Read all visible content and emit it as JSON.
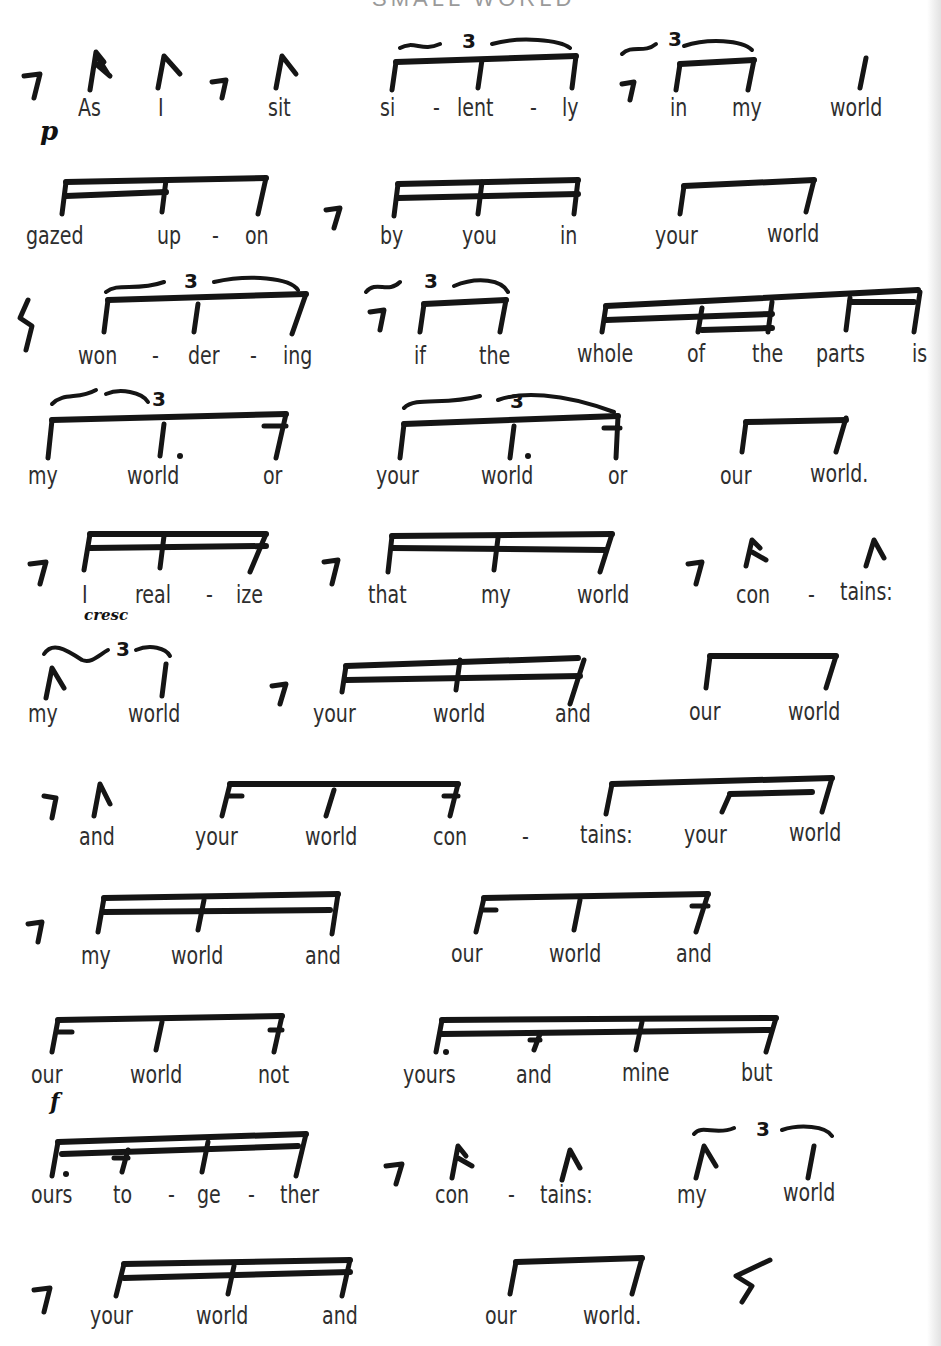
{
  "page": {
    "title_fragment": "SMALL WORLD",
    "lines": [
      {
        "id": 1,
        "text": "As I sit si-lent-ly in my world",
        "syllables": [
          {
            "t": "As",
            "x": 78,
            "y": 96
          },
          {
            "t": "I",
            "x": 158,
            "y": 96
          },
          {
            "t": "sit",
            "x": 268,
            "y": 96
          },
          {
            "t": "si",
            "x": 380,
            "y": 96
          },
          {
            "t": "-",
            "x": 433,
            "y": 96
          },
          {
            "t": "lent",
            "x": 457,
            "y": 96
          },
          {
            "t": "-",
            "x": 530,
            "y": 96
          },
          {
            "t": "ly",
            "x": 562,
            "y": 96
          },
          {
            "t": "in",
            "x": 670,
            "y": 96
          },
          {
            "t": "my",
            "x": 732,
            "y": 96
          },
          {
            "t": "world",
            "x": 830,
            "y": 96
          }
        ]
      },
      {
        "id": 2,
        "text": "gazed up-on by you in your world",
        "syllables": [
          {
            "t": "gazed",
            "x": 26,
            "y": 224
          },
          {
            "t": "up",
            "x": 157,
            "y": 224
          },
          {
            "t": "-",
            "x": 212,
            "y": 224
          },
          {
            "t": "on",
            "x": 245,
            "y": 224
          },
          {
            "t": "by",
            "x": 380,
            "y": 224
          },
          {
            "t": "you",
            "x": 462,
            "y": 224
          },
          {
            "t": "in",
            "x": 560,
            "y": 224
          },
          {
            "t": "your",
            "x": 655,
            "y": 224
          },
          {
            "t": "world",
            "x": 767,
            "y": 222
          }
        ]
      },
      {
        "id": 3,
        "text": "won-der-ing if the whole of the parts is",
        "syllables": [
          {
            "t": "won",
            "x": 78,
            "y": 344
          },
          {
            "t": "-",
            "x": 152,
            "y": 344
          },
          {
            "t": "der",
            "x": 188,
            "y": 344
          },
          {
            "t": "-",
            "x": 250,
            "y": 344
          },
          {
            "t": "ing",
            "x": 283,
            "y": 344
          },
          {
            "t": "if",
            "x": 414,
            "y": 344
          },
          {
            "t": "the",
            "x": 479,
            "y": 344
          },
          {
            "t": "whole",
            "x": 577,
            "y": 342
          },
          {
            "t": "of",
            "x": 687,
            "y": 342
          },
          {
            "t": "the",
            "x": 752,
            "y": 342
          },
          {
            "t": "parts",
            "x": 816,
            "y": 342
          },
          {
            "t": "is",
            "x": 912,
            "y": 342
          }
        ]
      },
      {
        "id": 4,
        "text": "my world or your world or our world.",
        "syllables": [
          {
            "t": "my",
            "x": 28,
            "y": 464
          },
          {
            "t": "world",
            "x": 127,
            "y": 464
          },
          {
            "t": "or",
            "x": 263,
            "y": 464
          },
          {
            "t": "your",
            "x": 376,
            "y": 464
          },
          {
            "t": "world",
            "x": 481,
            "y": 464
          },
          {
            "t": "or",
            "x": 608,
            "y": 464
          },
          {
            "t": "our",
            "x": 720,
            "y": 464
          },
          {
            "t": "world.",
            "x": 810,
            "y": 462
          }
        ]
      },
      {
        "id": 5,
        "text": "I real-ize that my world con-tains:",
        "syllables": [
          {
            "t": "I",
            "x": 82,
            "y": 583
          },
          {
            "t": "real",
            "x": 135,
            "y": 583
          },
          {
            "t": "-",
            "x": 206,
            "y": 583
          },
          {
            "t": "ize",
            "x": 236,
            "y": 583
          },
          {
            "t": "that",
            "x": 368,
            "y": 583
          },
          {
            "t": "my",
            "x": 481,
            "y": 583
          },
          {
            "t": "world",
            "x": 577,
            "y": 583
          },
          {
            "t": "con",
            "x": 736,
            "y": 583
          },
          {
            "t": "-",
            "x": 808,
            "y": 583
          },
          {
            "t": "tains:",
            "x": 840,
            "y": 580
          }
        ]
      },
      {
        "id": 6,
        "text": "my world your world and our world",
        "syllables": [
          {
            "t": "my",
            "x": 28,
            "y": 702
          },
          {
            "t": "world",
            "x": 128,
            "y": 702
          },
          {
            "t": "your",
            "x": 313,
            "y": 702
          },
          {
            "t": "world",
            "x": 433,
            "y": 702
          },
          {
            "t": "and",
            "x": 555,
            "y": 702
          },
          {
            "t": "our",
            "x": 689,
            "y": 700
          },
          {
            "t": "world",
            "x": 788,
            "y": 700
          }
        ]
      },
      {
        "id": 7,
        "text": "and your world con-tains: your world",
        "syllables": [
          {
            "t": "and",
            "x": 79,
            "y": 825
          },
          {
            "t": "your",
            "x": 195,
            "y": 825
          },
          {
            "t": "world",
            "x": 305,
            "y": 825
          },
          {
            "t": "con",
            "x": 433,
            "y": 825
          },
          {
            "t": "-",
            "x": 522,
            "y": 825
          },
          {
            "t": "tains:",
            "x": 580,
            "y": 823
          },
          {
            "t": "your",
            "x": 684,
            "y": 823
          },
          {
            "t": "world",
            "x": 789,
            "y": 821
          }
        ]
      },
      {
        "id": 8,
        "text": "my world and our world and",
        "syllables": [
          {
            "t": "my",
            "x": 81,
            "y": 944
          },
          {
            "t": "world",
            "x": 171,
            "y": 944
          },
          {
            "t": "and",
            "x": 305,
            "y": 944
          },
          {
            "t": "our",
            "x": 451,
            "y": 942
          },
          {
            "t": "world",
            "x": 549,
            "y": 942
          },
          {
            "t": "and",
            "x": 676,
            "y": 942
          }
        ]
      },
      {
        "id": 9,
        "text": "our world not yours and mine but",
        "syllables": [
          {
            "t": "our",
            "x": 31,
            "y": 1063
          },
          {
            "t": "world",
            "x": 130,
            "y": 1063
          },
          {
            "t": "not",
            "x": 258,
            "y": 1063
          },
          {
            "t": "yours",
            "x": 403,
            "y": 1063
          },
          {
            "t": "and",
            "x": 516,
            "y": 1063
          },
          {
            "t": "mine",
            "x": 622,
            "y": 1061
          },
          {
            "t": "but",
            "x": 741,
            "y": 1061
          }
        ]
      },
      {
        "id": 10,
        "text": "ours to-ge-ther con-tains: my world",
        "syllables": [
          {
            "t": "ours",
            "x": 31,
            "y": 1183
          },
          {
            "t": "to",
            "x": 113,
            "y": 1183
          },
          {
            "t": "-",
            "x": 168,
            "y": 1183
          },
          {
            "t": "ge",
            "x": 197,
            "y": 1183
          },
          {
            "t": "-",
            "x": 248,
            "y": 1183
          },
          {
            "t": "ther",
            "x": 280,
            "y": 1183
          },
          {
            "t": "con",
            "x": 435,
            "y": 1183
          },
          {
            "t": "-",
            "x": 508,
            "y": 1183
          },
          {
            "t": "tains:",
            "x": 540,
            "y": 1183
          },
          {
            "t": "my",
            "x": 677,
            "y": 1183
          },
          {
            "t": "world",
            "x": 783,
            "y": 1181
          }
        ]
      },
      {
        "id": 11,
        "text": "your world and our world.",
        "syllables": [
          {
            "t": "your",
            "x": 90,
            "y": 1304
          },
          {
            "t": "world",
            "x": 196,
            "y": 1304
          },
          {
            "t": "and",
            "x": 322,
            "y": 1304
          },
          {
            "t": "our",
            "x": 485,
            "y": 1304
          },
          {
            "t": "world.",
            "x": 583,
            "y": 1304
          }
        ]
      }
    ],
    "dynamics": [
      {
        "mark": "p",
        "x": 40,
        "y": 118,
        "size": 26
      },
      {
        "mark": "cresc",
        "x": 84,
        "y": 608,
        "size": 15
      },
      {
        "mark": "f",
        "x": 50,
        "y": 1090,
        "size": 22
      }
    ],
    "tuplet_label": "3"
  }
}
